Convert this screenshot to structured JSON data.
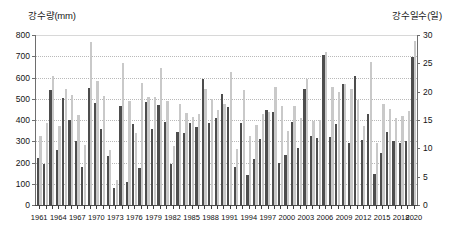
{
  "chart_data": {
    "type": "bar",
    "title": "",
    "subtitle": "",
    "xlabel": "",
    "ylabel": "강수량(mm)",
    "y2label": "강수일수(일)",
    "left_axis_title": "강수량(mm)",
    "right_axis_title": "강수일수(일)",
    "ylim": [
      0,
      800
    ],
    "y2lim": [
      0,
      30
    ],
    "ytick_labels": [
      "0",
      "100",
      "200",
      "300",
      "400",
      "500",
      "600",
      "700",
      "800"
    ],
    "ytick_values": [
      0,
      100,
      200,
      300,
      400,
      500,
      600,
      700,
      800
    ],
    "y2tick_labels": [
      "0",
      "5",
      "10",
      "15",
      "20",
      "25",
      "30"
    ],
    "y2tick_values": [
      0,
      5,
      10,
      15,
      20,
      25,
      30
    ],
    "grid": true,
    "legend_position": "none",
    "x": [
      1961,
      1962,
      1963,
      1964,
      1965,
      1966,
      1967,
      1968,
      1969,
      1970,
      1971,
      1972,
      1973,
      1974,
      1975,
      1976,
      1977,
      1978,
      1979,
      1980,
      1981,
      1982,
      1983,
      1984,
      1985,
      1986,
      1987,
      1988,
      1989,
      1990,
      1991,
      1992,
      1993,
      1994,
      1995,
      1996,
      1997,
      1998,
      1999,
      2000,
      2001,
      2002,
      2003,
      2004,
      2005,
      2006,
      2007,
      2008,
      2009,
      2010,
      2011,
      2012,
      2013,
      2014,
      2015,
      2016,
      2017,
      2018,
      2019,
      2020
    ],
    "xtick_labels": [
      "1961",
      "1964",
      "1967",
      "1970",
      "1973",
      "1976",
      "1979",
      "1982",
      "1985",
      "1988",
      "1991",
      "1994",
      "1997",
      "2000",
      "2003",
      "2006",
      "2009",
      "2012",
      "2015",
      "2018",
      "2020"
    ],
    "xtick_values": [
      1961,
      1964,
      1967,
      1970,
      1973,
      1976,
      1979,
      1982,
      1985,
      1988,
      1991,
      1994,
      1997,
      2000,
      2003,
      2006,
      2009,
      2012,
      2015,
      2018,
      2020
    ],
    "series": [
      {
        "name": "강수량(mm)",
        "axis": "left",
        "color": "#4d4d4d",
        "unit": "mm",
        "values": [
          222,
          193,
          542,
          259,
          502,
          400,
          303,
          181,
          552,
          479,
          360,
          229,
          79,
          466,
          108,
          383,
          176,
          486,
          357,
          472,
          392,
          194,
          344,
          340,
          388,
          367,
          592,
          385,
          409,
          521,
          459,
          177,
          384,
          140,
          218,
          311,
          445,
          436,
          196,
          237,
          390,
          266,
          546,
          324,
          317,
          705,
          322,
          380,
          568,
          292,
          605,
          308,
          429,
          146,
          243,
          344,
          299,
          294,
          303,
          697
        ]
      },
      {
        "name": "강수일수(일)",
        "axis": "right",
        "color": "#c9c9c9",
        "unit": "일",
        "values": [
          12.1,
          14.4,
          22.7,
          14.0,
          20.5,
          19.4,
          15.9,
          10.6,
          28.7,
          21.9,
          19.2,
          9.7,
          4.5,
          25.1,
          18.3,
          12.7,
          21.5,
          19.0,
          19.1,
          24.1,
          18.4,
          10.5,
          17.9,
          16.2,
          15.5,
          16.1,
          20.5,
          18.7,
          16.7,
          17.8,
          23.5,
          9.9,
          20.3,
          12.2,
          14.2,
          16.0,
          16.5,
          20.9,
          17.4,
          13.0,
          17.5,
          15.3,
          22.3,
          14.9,
          15.0,
          27.0,
          20.9,
          20.0,
          21.3,
          20.4,
          18.5,
          14.0,
          25.2,
          11.0,
          17.8,
          17.0,
          15.3,
          15.7,
          16.6,
          28.9
        ]
      }
    ]
  }
}
